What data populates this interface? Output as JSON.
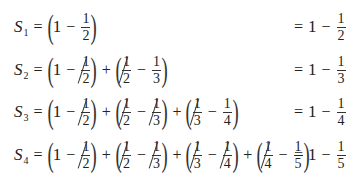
{
  "rows": [
    {
      "label": "S",
      "sub": "1",
      "terms": [
        {
          "a": "1",
          "b": "2",
          "cancel_a": false,
          "cancel_b": false
        }
      ],
      "result": {
        "one": "1",
        "num": "1",
        "den": "2"
      }
    },
    {
      "label": "S",
      "sub": "2",
      "terms": [
        {
          "a": "1",
          "b": "2",
          "cancel_b": true
        },
        {
          "a_num": "1",
          "a_den": "2",
          "b": "3",
          "cancel_a": true
        }
      ],
      "result": {
        "one": "1",
        "num": "1",
        "den": "3"
      }
    },
    {
      "label": "S",
      "sub": "3",
      "terms": [
        {
          "a": "1",
          "b": "2",
          "cancel_b": true
        },
        {
          "a_num": "1",
          "a_den": "2",
          "b": "3",
          "cancel_a": true,
          "cancel_b": true
        },
        {
          "a_num": "1",
          "a_den": "3",
          "b": "4",
          "cancel_a": true
        }
      ],
      "result": {
        "one": "1",
        "num": "1",
        "den": "4"
      }
    },
    {
      "label": "S",
      "sub": "4",
      "terms": [
        {
          "a": "1",
          "b": "2",
          "cancel_b": true
        },
        {
          "a_num": "1",
          "a_den": "2",
          "b": "3",
          "cancel_a": true,
          "cancel_b": true
        },
        {
          "a_num": "1",
          "a_den": "3",
          "b": "4",
          "cancel_a": true,
          "cancel_b": true
        },
        {
          "a_num": "1",
          "a_den": "4",
          "b": "5",
          "cancel_a": true
        }
      ],
      "result": {
        "one": "1",
        "num": "1",
        "den": "5"
      }
    }
  ],
  "symbols": {
    "eq": "=",
    "minus": "−",
    "plus": "+",
    "lparen": "(",
    "rparen": ")"
  }
}
